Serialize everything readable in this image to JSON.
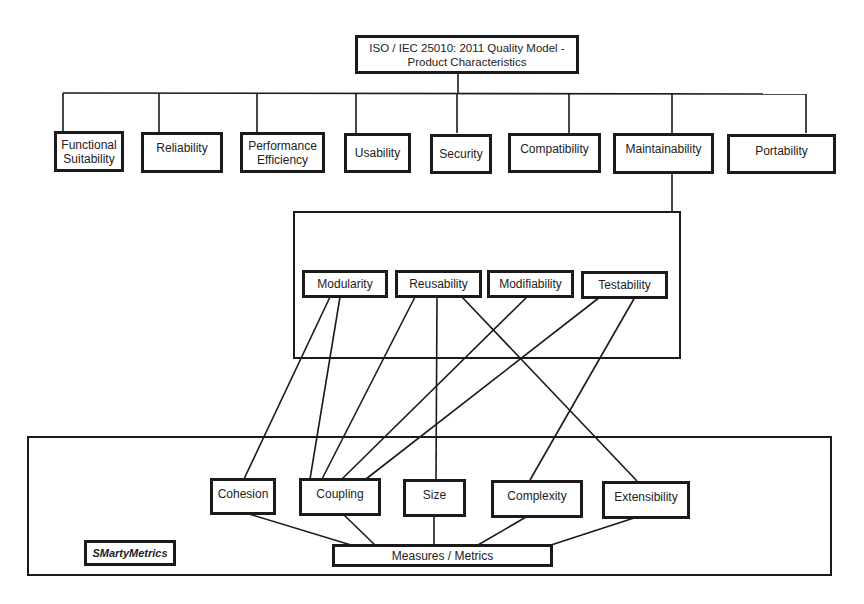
{
  "diagram": {
    "root": {
      "label": "ISO / IEC 25010: 2011 Quality Model -\nProduct Characteristics"
    },
    "characteristics": [
      {
        "id": "functional-suitability",
        "label": "Functional\nSuitability"
      },
      {
        "id": "reliability",
        "label": "Reliability"
      },
      {
        "id": "performance-efficiency",
        "label": "Performance\nEfficiency"
      },
      {
        "id": "usability",
        "label": "Usability"
      },
      {
        "id": "security",
        "label": "Security"
      },
      {
        "id": "compatibility",
        "label": "Compatibility"
      },
      {
        "id": "maintainability",
        "label": "Maintainability"
      },
      {
        "id": "portability",
        "label": "Portability"
      }
    ],
    "maintainability_subcharacteristics": [
      {
        "id": "modularity",
        "label": "Modularity"
      },
      {
        "id": "reusability",
        "label": "Reusability"
      },
      {
        "id": "modifiability",
        "label": "Modifiability"
      },
      {
        "id": "testability",
        "label": "Testability"
      }
    ],
    "metric_categories": [
      {
        "id": "cohesion",
        "label": "Cohesion"
      },
      {
        "id": "coupling",
        "label": "Coupling"
      },
      {
        "id": "size",
        "label": "Size"
      },
      {
        "id": "complexity",
        "label": "Complexity"
      },
      {
        "id": "extensibility",
        "label": "Extensibility"
      }
    ],
    "measures": {
      "label": "Measures / Metrics"
    },
    "framework": {
      "label": "SMartyMetrics"
    },
    "edges": [
      {
        "from": "root",
        "to": "functional-suitability"
      },
      {
        "from": "root",
        "to": "reliability"
      },
      {
        "from": "root",
        "to": "performance-efficiency"
      },
      {
        "from": "root",
        "to": "usability"
      },
      {
        "from": "root",
        "to": "security"
      },
      {
        "from": "root",
        "to": "compatibility"
      },
      {
        "from": "root",
        "to": "maintainability"
      },
      {
        "from": "root",
        "to": "portability"
      },
      {
        "from": "maintainability",
        "to": "maintainability-frame"
      },
      {
        "from": "modularity",
        "to": "cohesion"
      },
      {
        "from": "modularity",
        "to": "coupling"
      },
      {
        "from": "reusability",
        "to": "coupling"
      },
      {
        "from": "reusability",
        "to": "size"
      },
      {
        "from": "reusability",
        "to": "extensibility"
      },
      {
        "from": "modifiability",
        "to": "coupling"
      },
      {
        "from": "testability",
        "to": "coupling"
      },
      {
        "from": "testability",
        "to": "complexity"
      },
      {
        "from": "cohesion",
        "to": "measures"
      },
      {
        "from": "coupling",
        "to": "measures"
      },
      {
        "from": "size",
        "to": "measures"
      },
      {
        "from": "complexity",
        "to": "measures"
      },
      {
        "from": "extensibility",
        "to": "measures"
      }
    ]
  }
}
